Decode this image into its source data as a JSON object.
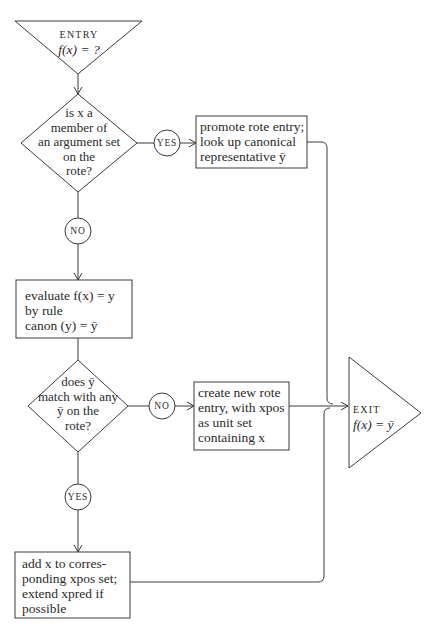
{
  "diagram": {
    "type": "flowchart",
    "entry": {
      "label": "ENTRY",
      "formula": "f(x) = ?"
    },
    "decision1": {
      "lines": [
        "is x a",
        "member of",
        "an argument set",
        "on the",
        "rote?"
      ]
    },
    "decision1_yes": "YES",
    "decision1_no": "NO",
    "promote_box": {
      "lines": [
        "promote rote entry;",
        "look up canonical",
        "representative ȳ"
      ]
    },
    "evaluate_box": {
      "lines": [
        "evaluate f(x) = y",
        "by rule",
        "canon (y) = ȳ"
      ]
    },
    "decision2": {
      "lines": [
        "does ȳ",
        "match with any",
        "ȳ on the",
        "rote?"
      ]
    },
    "decision2_no": "NO",
    "decision2_yes": "YES",
    "create_box": {
      "lines": [
        "create new rote",
        "entry, with xpos",
        "as unit set",
        "containing x"
      ]
    },
    "add_box": {
      "lines": [
        "add x to corres-",
        "ponding xpos set;",
        "extend xpred if",
        "possible"
      ]
    },
    "exit": {
      "label": "EXIT",
      "formula": "f(x) = ȳ"
    },
    "stroke_color": "#3a3a3a",
    "text_color": "#2a2a2a"
  }
}
